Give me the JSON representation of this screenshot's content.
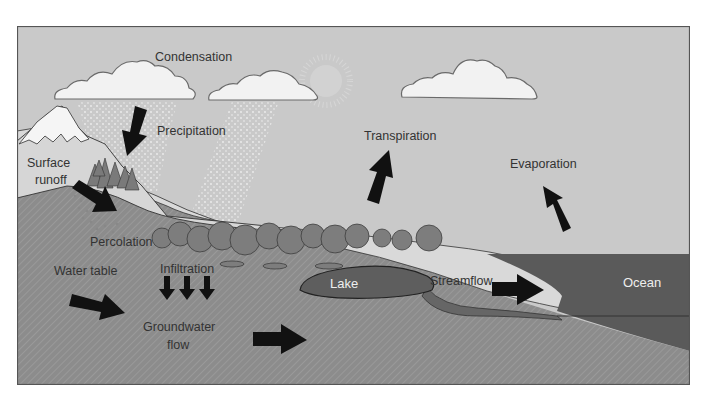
{
  "diagram": {
    "colors": {
      "sky": "#c9c9c9",
      "frame_border": "#555555",
      "cloud_fill": "#f2f2f2",
      "cloud_stroke": "#6a6a6a",
      "rain": "#e6e6e6",
      "snow": "#f5f5f5",
      "mountain": "#a8a8a8",
      "soil_light": "#d9d9d9",
      "groundwater": "#8c8c8c",
      "tree": "#7d7d7d",
      "lake": "#5e5e5e",
      "ocean": "#5a5a5a",
      "arrow": "#111111",
      "label_text": "#333333",
      "label_light": "#eeeeee"
    },
    "labels": {
      "condensation": "Condensation",
      "precipitation": "Precipitation",
      "transpiration": "Transpiration",
      "evaporation": "Evaporation",
      "surface_runoff_line1": "Surface",
      "surface_runoff_line2": "runoff",
      "percolation": "Percolation",
      "infiltration": "Infiltration",
      "water_table": "Water table",
      "groundwater_flow_line1": "Groundwater",
      "groundwater_flow_line2": "flow",
      "lake": "Lake",
      "streamflow": "Streamflow",
      "ocean": "Ocean"
    },
    "nodes": [
      {
        "id": "clouds",
        "label": "Condensation"
      },
      {
        "id": "rain",
        "label": "Precipitation"
      },
      {
        "id": "mountain",
        "label": "Surface runoff"
      },
      {
        "id": "soil",
        "label": "Percolation"
      },
      {
        "id": "soil-infiltration",
        "label": "Infiltration"
      },
      {
        "id": "water-table",
        "label": "Water table"
      },
      {
        "id": "groundwater",
        "label": "Groundwater flow"
      },
      {
        "id": "forest",
        "label": "Transpiration"
      },
      {
        "id": "lake",
        "label": "Lake"
      },
      {
        "id": "stream",
        "label": "Streamflow"
      },
      {
        "id": "ocean",
        "label": "Ocean"
      },
      {
        "id": "ocean-surface",
        "label": "Evaporation"
      }
    ],
    "edges": [
      {
        "from": "clouds",
        "to": "rain",
        "label": "Precipitation",
        "direction": "down-left"
      },
      {
        "from": "mountain",
        "to": "soil",
        "label": "Surface runoff",
        "direction": "down-right"
      },
      {
        "from": "soil",
        "to": "groundwater",
        "label": "Infiltration",
        "direction": "down",
        "count": 3
      },
      {
        "from": "water-table",
        "to": "groundwater",
        "label": "Groundwater flow",
        "direction": "right",
        "count": 2
      },
      {
        "from": "forest",
        "to": "clouds",
        "label": "Transpiration",
        "direction": "up-right"
      },
      {
        "from": "ocean",
        "to": "clouds",
        "label": "Evaporation",
        "direction": "up-left"
      },
      {
        "from": "lake",
        "to": "ocean",
        "label": "Streamflow",
        "direction": "right"
      }
    ]
  }
}
